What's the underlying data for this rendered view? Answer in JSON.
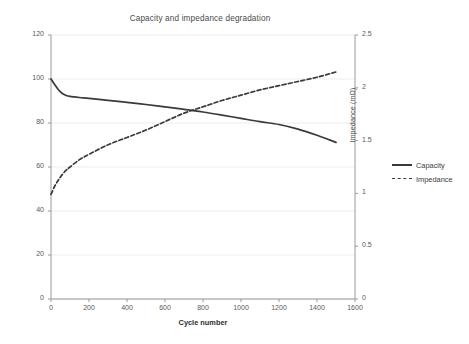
{
  "chart_data": {
    "type": "line",
    "title": "Capacity and impedance degradation",
    "xlabel": "Cycle number",
    "ylabel": "Capacity (% of initial)",
    "y2label": "Impedance (mΩ)",
    "xlim": [
      0,
      1600
    ],
    "ylim": [
      0,
      120
    ],
    "y2lim": [
      0,
      2.5
    ],
    "xticks": [
      0,
      200,
      400,
      600,
      800,
      1000,
      1200,
      1400,
      1600
    ],
    "xtick_labels": [
      "0",
      "200",
      "400",
      "600",
      "800",
      "1000",
      "1200",
      "1400",
      "1600"
    ],
    "yticks": [
      0,
      20,
      40,
      60,
      80,
      100,
      120
    ],
    "ytick_labels": [
      "0",
      "20",
      "40",
      "60",
      "80",
      "100",
      "120"
    ],
    "y2ticks": [
      0,
      0.5,
      1,
      1.5,
      2,
      2.5
    ],
    "y2tick_labels": [
      "0",
      "0.5",
      "1",
      "1.5",
      "2",
      "2.5"
    ],
    "grid": true,
    "grid_axis": "y",
    "legend_position": "right",
    "line_color": "#3a3a3a",
    "grid_color": "#ededed",
    "axis_color": "#9a9a9a",
    "series": [
      {
        "name": "Capacity",
        "axis": "left",
        "style": "solid",
        "x": [
          0,
          20,
          40,
          60,
          80,
          100,
          150,
          200,
          300,
          400,
          500,
          600,
          700,
          800,
          900,
          1000,
          1100,
          1200,
          1300,
          1400,
          1500
        ],
        "values": [
          100.0,
          97.4,
          95.0,
          93.4,
          92.5,
          92.1,
          91.6,
          91.2,
          90.3,
          89.4,
          88.4,
          87.3,
          86.2,
          85.0,
          83.6,
          82.1,
          80.6,
          79.3,
          77.2,
          74.4,
          71.2
        ]
      },
      {
        "name": "Impedance",
        "axis": "right",
        "style": "dashed",
        "x": [
          0,
          20,
          40,
          60,
          80,
          100,
          150,
          200,
          300,
          400,
          500,
          600,
          700,
          800,
          900,
          1000,
          1100,
          1200,
          1300,
          1400,
          1500
        ],
        "values": [
          0.99,
          1.07,
          1.13,
          1.18,
          1.22,
          1.25,
          1.32,
          1.37,
          1.46,
          1.53,
          1.6,
          1.68,
          1.76,
          1.82,
          1.88,
          1.93,
          1.98,
          2.02,
          2.06,
          2.1,
          2.15
        ]
      }
    ]
  }
}
